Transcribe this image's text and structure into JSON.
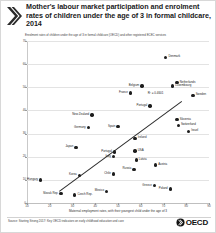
{
  "header": {
    "title": "Mother's labour market participation and enrolment rates of children under the age of 3 in formal childcare, 2014",
    "chevron_icon": "double-chevron-right-icon"
  },
  "subtitle": "Enrolment rates of children under the age of 3 in formal childcare (OECD) and other registered ECEC services",
  "footer": {
    "source": "Source: Starting Strong 2017: Key OECD indicators on early childhood education and care",
    "logo_text": "OECD",
    "logo_icon": "oecd-logo-icon"
  },
  "chart_data": {
    "type": "scatter",
    "title": "Mother's labour market participation and enrolment rates of children under the age of 3 in formal childcare, 2014",
    "subtitle": "Enrolment rates of children under the age of 3 in formal childcare (OECD) and other registered ECEC services",
    "xlabel": "Maternal employment rates, with their youngest child under the age of 3",
    "ylabel": "%",
    "xlim": [
      10,
      90
    ],
    "ylim": [
      0,
      70
    ],
    "xticks": [
      10,
      20,
      30,
      40,
      50,
      60,
      70,
      80,
      90
    ],
    "yticks": [
      0,
      10,
      20,
      30,
      40,
      50,
      60,
      70
    ],
    "grid": true,
    "legend": "none",
    "annotation": "R² = 0.4601",
    "trendline": {
      "x0": 24,
      "y0": 5,
      "x1": 78,
      "y1": 44
    },
    "points": [
      {
        "name": "Denmark",
        "x": 71.0,
        "y": 63.0,
        "label_pos": "l"
      },
      {
        "name": "Netherlands",
        "x": 76.0,
        "y": 52.0,
        "label_pos": "l"
      },
      {
        "name": "Luxembourg",
        "x": 74.0,
        "y": 50.5,
        "label_pos": "l"
      },
      {
        "name": "Belgium",
        "x": 60.5,
        "y": 50.5,
        "label_pos": "r"
      },
      {
        "name": "France",
        "x": 55.5,
        "y": 47.5,
        "label_pos": "r"
      },
      {
        "name": "Portugal",
        "x": 64.0,
        "y": 42.0,
        "label_pos": "r"
      },
      {
        "name": "Slovenia",
        "x": 76.0,
        "y": 36.0,
        "label_pos": "l"
      },
      {
        "name": "Switzerland",
        "x": 76.5,
        "y": 33.5,
        "label_pos": "l"
      },
      {
        "name": "New Zealand",
        "x": 38.5,
        "y": 38.0,
        "label_pos": "r"
      },
      {
        "name": "Sweden",
        "x": 83.0,
        "y": 46.5,
        "label_pos": "l"
      },
      {
        "name": "Israel",
        "x": 81.0,
        "y": 31.0,
        "label_pos": "l"
      },
      {
        "name": "Germany",
        "x": 37.0,
        "y": 32.5,
        "label_pos": "r"
      },
      {
        "name": "Spain",
        "x": 50.0,
        "y": 33.0,
        "label_pos": "r"
      },
      {
        "name": "Ireland",
        "x": 57.5,
        "y": 28.0,
        "label_pos": "l"
      },
      {
        "name": "Japan",
        "x": 31.5,
        "y": 24.0,
        "label_pos": "r"
      },
      {
        "name": "Portugal",
        "x": 48.5,
        "y": 22.0,
        "label_pos": "r"
      },
      {
        "name": "USA",
        "x": 57.5,
        "y": 22.5,
        "label_pos": "l"
      },
      {
        "name": "Italy",
        "x": 48.0,
        "y": 20.0,
        "label_pos": "r"
      },
      {
        "name": "Latvia",
        "x": 58.0,
        "y": 18.5,
        "label_pos": "l"
      },
      {
        "name": "Austria",
        "x": 66.5,
        "y": 16.5,
        "label_pos": "l"
      },
      {
        "name": "Russia",
        "x": 57.0,
        "y": 14.5,
        "label_pos": "r"
      },
      {
        "name": "Chile",
        "x": 48.0,
        "y": 12.5,
        "label_pos": "r"
      },
      {
        "name": "Korea",
        "x": 33.0,
        "y": 12.0,
        "label_pos": "r"
      },
      {
        "name": "Hungary",
        "x": 16.0,
        "y": 10.0,
        "label_pos": "r"
      },
      {
        "name": "Greece",
        "x": 66.0,
        "y": 7.5,
        "label_pos": "r"
      },
      {
        "name": "Poland",
        "x": 73.0,
        "y": 6.0,
        "label_pos": "r"
      },
      {
        "name": "Mexico",
        "x": 45.0,
        "y": 5.0,
        "label_pos": "r"
      },
      {
        "name": "Czech Rep.",
        "x": 31.0,
        "y": 3.5,
        "label_pos": "l"
      },
      {
        "name": "Slovak Rep.",
        "x": 25.0,
        "y": 4.0,
        "label_pos": "r"
      }
    ]
  }
}
